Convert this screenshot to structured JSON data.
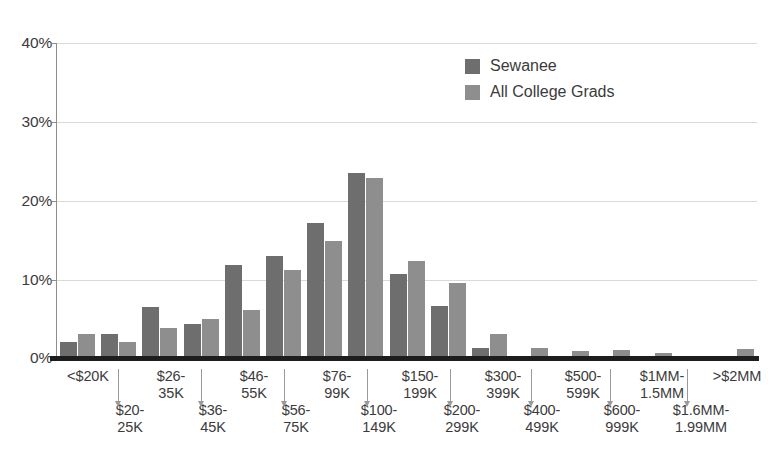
{
  "chart_data": {
    "type": "bar",
    "title": "",
    "xlabel": "",
    "ylabel": "",
    "ylim": [
      0,
      40
    ],
    "yticks": [
      0,
      10,
      20,
      30,
      40
    ],
    "ytick_labels": [
      "0%",
      "10%",
      "20%",
      "30%",
      "40%"
    ],
    "grid": true,
    "legend_position": "top-right",
    "categories": [
      "<$20K",
      "$20-25K",
      "$26-35K",
      "$36-45K",
      "$46-55K",
      "$56-75K",
      "$76-99K",
      "$100-149K",
      "$150-199K",
      "$200-299K",
      "$300-399K",
      "$400-499K",
      "$500-599K",
      "$600-999K",
      "$1MM-1.5MM",
      "$1.6MM-1.99MM",
      ">$2MM"
    ],
    "series": [
      {
        "name": "Sewanee",
        "color": "#6e6e6e",
        "values": [
          2.0,
          3.0,
          6.5,
          4.3,
          11.8,
          12.9,
          17.1,
          23.5,
          10.7,
          6.6,
          1.3,
          0.0,
          0.0,
          0.0,
          0.0,
          0.0,
          0.0
        ]
      },
      {
        "name": "All College Grads",
        "color": "#8e8e8e",
        "values": [
          3.0,
          2.0,
          3.8,
          5.0,
          6.1,
          11.2,
          14.9,
          22.9,
          12.3,
          9.5,
          3.0,
          1.3,
          0.9,
          1.0,
          0.6,
          0.0,
          1.2
        ]
      }
    ]
  },
  "legend": {
    "items": [
      {
        "label": "Sewanee",
        "color": "#6e6e6e"
      },
      {
        "label": "All College Grads",
        "color": "#8e8e8e"
      }
    ]
  },
  "axis": {
    "y_ticks": [
      {
        "label": "40%",
        "value": 40
      },
      {
        "label": "30%",
        "value": 30
      },
      {
        "label": "20%",
        "value": 20
      },
      {
        "label": "10%",
        "value": 10
      },
      {
        "label": "0%",
        "value": 0
      }
    ]
  },
  "x_axis_labels": {
    "top_row": [
      {
        "line1": "<$20K",
        "line2": ""
      },
      {
        "line1": "$26-",
        "line2": "35K"
      },
      {
        "line1": "$46-",
        "line2": "55K"
      },
      {
        "line1": "$76-",
        "line2": "99K"
      },
      {
        "line1": "$150-",
        "line2": "199K"
      },
      {
        "line1": "$300-",
        "line2": "399K"
      },
      {
        "line1": "$500-",
        "line2": "599K"
      },
      {
        "line1": "$1MM-",
        "line2": "1.5MM"
      },
      {
        "line1": ">$2MM",
        "line2": ""
      }
    ],
    "bottom_row": [
      {
        "line1": "$20-",
        "line2": "25K"
      },
      {
        "line1": "$36-",
        "line2": "45K"
      },
      {
        "line1": "$56-",
        "line2": "75K"
      },
      {
        "line1": "$100-",
        "line2": "149K"
      },
      {
        "line1": "$200-",
        "line2": "299K"
      },
      {
        "line1": "$400-",
        "line2": "499K"
      },
      {
        "line1": "$600-",
        "line2": "999K"
      },
      {
        "line1": "$1.6MM-",
        "line2": "1.99MM"
      }
    ]
  }
}
